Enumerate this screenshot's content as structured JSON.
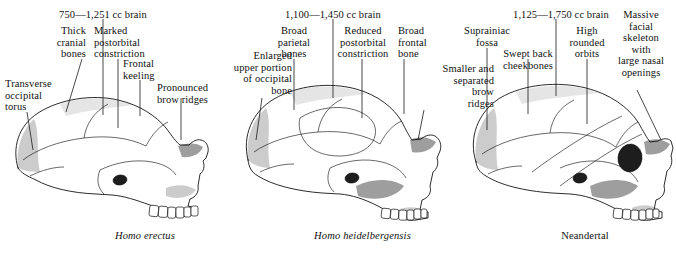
{
  "figure": {
    "background_color": "#ffffff",
    "text_color": "#111111",
    "line_color": "#1b1b1b"
  },
  "specimens": [
    {
      "id": "homo-erectus",
      "caption": "Homo erectus",
      "caption_style": "italic",
      "brain_volume_label": "750—1,251 cc brain",
      "labels": [
        "Thick\ncranial\nbones",
        "Marked\npostorbital\nconstriction",
        "Frontal\nkeeling",
        "Pronounced\nbrow ridges",
        "Transverse\noccipital\ntorus"
      ]
    },
    {
      "id": "homo-heidelbergensis",
      "caption": "Homo heidelbergensis",
      "caption_style": "italic",
      "brain_volume_label": "1,100—1,450 cc brain",
      "labels": [
        "Enlarged\nupper portion\nof occipital\nbone",
        "Broad\nparietal\nbones",
        "Reduced\npostorbital\nconstriction",
        "Broad\nfrontal\nbone",
        "Smaller and\nseparated\nbrow\nridges"
      ]
    },
    {
      "id": "neandertal",
      "caption": "Neandertal",
      "caption_style": "upright",
      "brain_volume_label": "1,125—1,750 cc brain",
      "labels": [
        "Suprainiac\nfossa",
        "Swept back\ncheekbones",
        "High\nrounded\norbits",
        "Massive\nfacial\nskeleton\nwith\nlarge nasal\nopenings"
      ]
    }
  ],
  "annotations": {
    "erectus": {
      "brain": "750—1,251 cc brain",
      "thick_cranial_bones": "Thick\ncranial\nbones",
      "postorbital": "Marked\npostorbital\nconstriction",
      "frontal_keeling": "Frontal\nkeeling",
      "brow_ridges": "Pronounced\nbrow ridges",
      "occipital_torus": "Transverse\noccipital\ntorus"
    },
    "heidelbergensis": {
      "brain": "1,100—1,450 cc brain",
      "occipital": "Enlarged\nupper portion\nof occipital\nbone",
      "parietal": "Broad\nparietal\nbones",
      "postorbital": "Reduced\npostorbital\nconstriction",
      "frontal": "Broad\nfrontal\nbone",
      "brow_ridges": "Smaller and\nseparated\nbrow\nridges"
    },
    "neandertal": {
      "brain": "1,125—1,750 cc brain",
      "suprainiac": "Suprainiac\nfossa",
      "cheekbones": "Swept back\ncheekbones",
      "orbits": "High\nrounded\norbits",
      "facial_skeleton": "Massive\nfacial\nskeleton\nwith\nlarge nasal\nopenings"
    }
  },
  "captions": {
    "erectus": "Homo erectus",
    "heidelbergensis": "Homo heidelbergensis",
    "neandertal": "Neandertal"
  }
}
